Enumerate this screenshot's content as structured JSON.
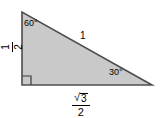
{
  "figure": {
    "type": "geometry-diagram",
    "fill_color": "#c9c9c9",
    "stroke_color": "#4d4d4d",
    "text_color": "#000000",
    "background_color": "#ffffff",
    "vertices": {
      "apex": [
        22,
        12
      ],
      "right_angle": [
        22,
        85
      ],
      "base_right": [
        152,
        85
      ]
    },
    "labels": {
      "angle_top_left": "60°",
      "angle_bottom_right": "30°",
      "hypotenuse": "1",
      "left_leg_numerator": "1",
      "left_leg_denominator": "2",
      "base_radical": "√",
      "base_radicand": "3",
      "base_denominator": "2"
    }
  }
}
